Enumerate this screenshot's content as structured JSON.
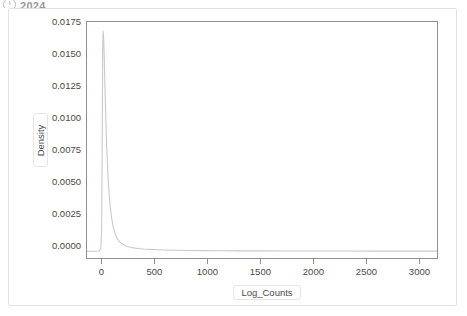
{
  "header": {
    "icon": "clock-icon",
    "title": "2024"
  },
  "chart_data": {
    "type": "line",
    "kind": "kde-density",
    "title": "",
    "xlabel": "Log_Counts",
    "ylabel": "Density",
    "xlim": [
      -145,
      3175
    ],
    "ylim": [
      -0.00055,
      0.01855
    ],
    "xticks": [
      0,
      500,
      1000,
      1500,
      2000,
      2500,
      3000
    ],
    "xtick_labels": [
      "0",
      "500",
      "1000",
      "1500",
      "2000",
      "2500",
      "3000"
    ],
    "yticks": [
      0.0,
      0.0025,
      0.005,
      0.0075,
      0.01,
      0.0125,
      0.015,
      0.0175
    ],
    "ytick_labels": [
      "0.0000",
      "0.0025",
      "0.0050",
      "0.0075",
      "0.0100",
      "0.0125",
      "0.0150",
      "0.0175"
    ],
    "grid": false,
    "legend": null,
    "line_color": "#c9c9c9",
    "axis_color": "#8f8f8f",
    "series": [
      {
        "name": "Density",
        "x": [
          -145,
          -60,
          -30,
          -14,
          -6,
          0,
          4,
          8,
          14,
          20,
          26,
          34,
          42,
          52,
          62,
          74,
          88,
          104,
          122,
          142,
          165,
          190,
          220,
          255,
          295,
          340,
          390,
          450,
          520,
          600,
          700,
          820,
          960,
          1120,
          1300,
          1500,
          1750,
          2000,
          2300,
          2650,
          3000,
          3175
        ],
        "y": [
          0.0,
          0.0,
          2e-05,
          0.00022,
          0.0018,
          0.0098,
          0.0163,
          0.01782,
          0.01705,
          0.0152,
          0.0131,
          0.01055,
          0.0084,
          0.00645,
          0.00498,
          0.00372,
          0.00272,
          0.00196,
          0.00141,
          0.00102,
          0.00076,
          0.00058,
          0.00044,
          0.00034,
          0.00027,
          0.00022,
          0.00018,
          0.00015,
          0.00012,
          0.0001,
          8e-05,
          6e-05,
          5e-05,
          4e-05,
          3e-05,
          2.5e-05,
          2e-05,
          1.5e-05,
          1e-05,
          7e-06,
          4e-06,
          3e-06
        ]
      }
    ],
    "peak": {
      "x": 8,
      "y": 0.01782
    }
  }
}
